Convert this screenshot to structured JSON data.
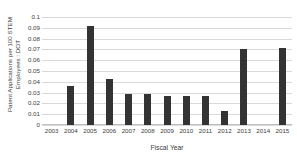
{
  "chart_data": {
    "type": "bar",
    "title": "",
    "xlabel": "Fiscal Year",
    "ylabel_lines": [
      "Patent Applications per 100 STEM",
      "Employees : DOT"
    ],
    "ylabel": "Patent Applications per 100 STEM Employees : DOT",
    "categories": [
      "2003",
      "2004",
      "2005",
      "2006",
      "2007",
      "2008",
      "2009",
      "2010",
      "2011",
      "2012",
      "2013",
      "2014",
      "2015"
    ],
    "values": [
      0,
      0.036,
      0.092,
      0.043,
      0.029,
      0.029,
      0.027,
      0.027,
      0.027,
      0.013,
      0.07,
      0,
      0.071
    ],
    "ylim": [
      0,
      0.1
    ],
    "ytick_values": [
      0,
      0.01,
      0.02,
      0.03,
      0.04,
      0.05,
      0.06,
      0.07,
      0.08,
      0.09,
      0.1
    ],
    "ytick_labels": [
      "0",
      "0.01",
      "0.02",
      "0.03",
      "0.04",
      "0.05",
      "0.06",
      "0.07",
      "0.08",
      "0.09",
      "0.1"
    ],
    "grid": true,
    "legend": false,
    "bar_color": "#333333",
    "grid_color": "#d9d9d9"
  }
}
